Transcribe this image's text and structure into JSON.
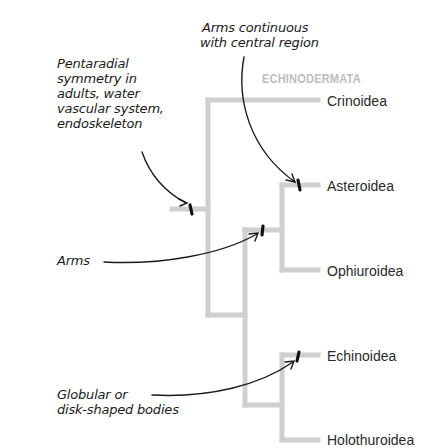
{
  "diagram": {
    "group_label": "ECHINODERMATA",
    "taxa": [
      {
        "name": "Crinoidea"
      },
      {
        "name": "Asteroidea"
      },
      {
        "name": "Ophiuroidea"
      },
      {
        "name": "Echinoidea"
      },
      {
        "name": "Holothuroidea"
      }
    ],
    "annotations": {
      "pentaradial": [
        "Pentaradial",
        "symmetry in",
        "adults, water",
        "vascular system,",
        "endoskeleton"
      ],
      "arms_continuous": [
        "Arms continuous",
        "with central region"
      ],
      "arms": "Arms",
      "globular": [
        "Globular or",
        "disk-shaped bodies"
      ]
    },
    "colors": {
      "branch": "#cfcfcf",
      "annotation": "#1a1a1a",
      "group_label": "#bdbdbd"
    }
  }
}
